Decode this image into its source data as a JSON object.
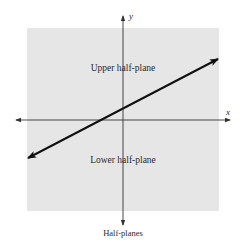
{
  "diagram": {
    "caption": "Half-planes",
    "axes": {
      "x_label": "x",
      "y_label": "y"
    },
    "regions": {
      "upper": "Upper half-plane",
      "lower": "Lower half-plane"
    },
    "line": {
      "description": "boundary line with positive slope, double-headed arrow",
      "color": "#111111"
    },
    "colors": {
      "plane_fill": "#e6e6e6",
      "axis": "#333333",
      "background": "#ffffff"
    }
  }
}
